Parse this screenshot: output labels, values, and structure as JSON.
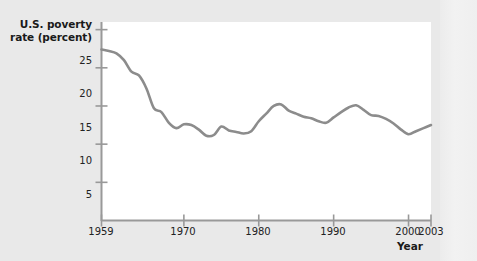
{
  "chart_data": {
    "type": "line",
    "title": "",
    "ylabel": "U.S. poverty\nrate (percent)",
    "ylabel_line1": "U.S. poverty",
    "ylabel_line2": "rate (percent)",
    "xlabel": "Year",
    "xlim": [
      1959,
      2003
    ],
    "ylim": [
      0,
      26
    ],
    "grid": false,
    "legend": null,
    "line_color": "#8c8c8c",
    "plot_background": "#ffffff",
    "figure_background": "#e9e9e9",
    "yticks": [
      25,
      20,
      15,
      10,
      5
    ],
    "ytick_labels": [
      "25",
      "20",
      "15",
      "10",
      "5"
    ],
    "xticks": [
      1959,
      1970,
      1980,
      1990,
      2000,
      2003
    ],
    "xtick_labels": [
      "1959",
      "1970",
      "1980",
      "1990",
      "2000",
      "2003"
    ],
    "x": [
      1959,
      1960,
      1961,
      1962,
      1963,
      1964,
      1965,
      1966,
      1967,
      1968,
      1969,
      1970,
      1971,
      1972,
      1973,
      1974,
      1975,
      1976,
      1977,
      1978,
      1979,
      1980,
      1981,
      1982,
      1983,
      1984,
      1985,
      1986,
      1987,
      1988,
      1989,
      1990,
      1991,
      1992,
      1993,
      1994,
      1995,
      1996,
      1997,
      1998,
      1999,
      2000,
      2001,
      2002,
      2003
    ],
    "values": [
      22.4,
      22.2,
      21.9,
      21.0,
      19.5,
      19.0,
      17.3,
      14.7,
      14.2,
      12.8,
      12.1,
      12.6,
      12.5,
      11.9,
      11.1,
      11.2,
      12.3,
      11.8,
      11.6,
      11.4,
      11.7,
      13.0,
      14.0,
      15.0,
      15.2,
      14.4,
      14.0,
      13.6,
      13.4,
      13.0,
      12.8,
      13.5,
      14.2,
      14.8,
      15.1,
      14.5,
      13.8,
      13.7,
      13.3,
      12.7,
      11.9,
      11.3,
      11.7,
      12.1,
      12.5
    ],
    "ylabel_unit": "percent",
    "source_note": ""
  },
  "figure": {
    "name": "us-poverty-rate-line-chart"
  }
}
